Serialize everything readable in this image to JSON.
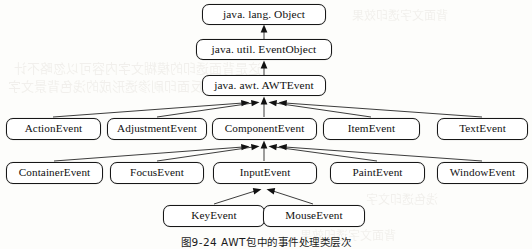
{
  "figure": {
    "caption": "图9-24    AWT包中的事件处理类层次",
    "kind": "class-hierarchy-diagram"
  },
  "nodes": {
    "object": {
      "label": "java. lang. Object"
    },
    "event_object": {
      "label": "java. util. EventObject"
    },
    "awt_event": {
      "label": "java. awt. AWTEvent"
    },
    "action_event": {
      "label": "ActionEvent"
    },
    "adjustment_event": {
      "label": "AdjustmentEvent"
    },
    "component_event": {
      "label": "ComponentEvent"
    },
    "item_event": {
      "label": "ItemEvent"
    },
    "text_event": {
      "label": "TextEvent"
    },
    "container_event": {
      "label": "ContainerEvent"
    },
    "focus_event": {
      "label": "FocusEvent"
    },
    "input_event": {
      "label": "InputEvent"
    },
    "paint_event": {
      "label": "PaintEvent"
    },
    "window_event": {
      "label": "WindowEvent"
    },
    "key_event": {
      "label": "KeyEvent"
    },
    "mouse_event": {
      "label": "MouseEvent"
    }
  },
  "hierarchy": [
    {
      "parent": "java. lang. Object",
      "child": "java. util. EventObject"
    },
    {
      "parent": "java. util. EventObject",
      "child": "java. awt. AWTEvent"
    },
    {
      "parent": "java. awt. AWTEvent",
      "child": "ActionEvent"
    },
    {
      "parent": "java. awt. AWTEvent",
      "child": "AdjustmentEvent"
    },
    {
      "parent": "java. awt. AWTEvent",
      "child": "ComponentEvent"
    },
    {
      "parent": "java. awt. AWTEvent",
      "child": "ItemEvent"
    },
    {
      "parent": "java. awt. AWTEvent",
      "child": "TextEvent"
    },
    {
      "parent": "ComponentEvent",
      "child": "ContainerEvent"
    },
    {
      "parent": "ComponentEvent",
      "child": "FocusEvent"
    },
    {
      "parent": "ComponentEvent",
      "child": "InputEvent"
    },
    {
      "parent": "ComponentEvent",
      "child": "PaintEvent"
    },
    {
      "parent": "ComponentEvent",
      "child": "WindowEvent"
    },
    {
      "parent": "InputEvent",
      "child": "KeyEvent"
    },
    {
      "parent": "InputEvent",
      "child": "MouseEvent"
    }
  ],
  "watermark": {
    "line1": "这是背面透印的模糊文字内容可以忽略不计",
    "line2": "反面印刷渗透形成的浅色背景文字",
    "line3": "背面文字透印效果",
    "line4": "浅色透印文字"
  },
  "colors": {
    "page_background": "#fdfdfb",
    "box_fill": "#ffffff",
    "box_border": "#171717",
    "connector": "#1a1a1a",
    "text": "#101010"
  }
}
